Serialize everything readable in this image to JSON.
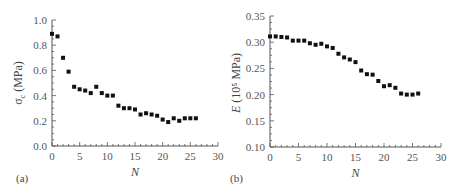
{
  "chart_data": [
    {
      "panel": "(a)",
      "type": "scatter",
      "title": "",
      "xlabel": "N",
      "ylabel": "σc (MPa)",
      "ylabel_main": "σ",
      "ylabel_sub": "c",
      "ylabel_unit": " (MPa)",
      "xlim": [
        0,
        30
      ],
      "ylim": [
        0.0,
        1.0
      ],
      "xticks": [
        0,
        5,
        10,
        15,
        20,
        25,
        30
      ],
      "xtick_labels": [
        "0",
        "5",
        "10",
        "15",
        "20",
        "25",
        "30"
      ],
      "yticks": [
        0.0,
        0.2,
        0.4,
        0.6,
        0.8,
        1.0
      ],
      "ytick_labels": [
        "0.0",
        "0.2",
        "0.4",
        "0.6",
        "0.8",
        "1.0"
      ],
      "grid": false,
      "x": [
        0,
        1,
        2,
        3,
        4,
        5,
        6,
        7,
        8,
        9,
        10,
        11,
        12,
        13,
        14,
        15,
        16,
        17,
        18,
        19,
        20,
        21,
        22,
        23,
        24,
        25,
        26
      ],
      "y": [
        0.89,
        0.87,
        0.7,
        0.59,
        0.47,
        0.45,
        0.44,
        0.42,
        0.47,
        0.42,
        0.4,
        0.4,
        0.32,
        0.3,
        0.3,
        0.29,
        0.25,
        0.26,
        0.25,
        0.24,
        0.21,
        0.19,
        0.22,
        0.2,
        0.22,
        0.22,
        0.22
      ]
    },
    {
      "panel": "(b)",
      "type": "scatter",
      "title": "",
      "xlabel": "N",
      "ylabel": "E (10^5 MPa)",
      "ylabel_main": "E",
      "ylabel_unit": " (10⁵ MPa)",
      "xlim": [
        0,
        30
      ],
      "ylim": [
        0.1,
        0.35
      ],
      "xticks": [
        0,
        5,
        10,
        15,
        20,
        25,
        30
      ],
      "xtick_labels": [
        "0",
        "5",
        "10",
        "15",
        "20",
        "25",
        "30"
      ],
      "yticks": [
        0.1,
        0.15,
        0.2,
        0.25,
        0.3,
        0.35
      ],
      "ytick_labels": [
        "0.10",
        "0.15",
        "0.20",
        "0.25",
        "0.30",
        "0.35"
      ],
      "grid": false,
      "x": [
        0,
        1,
        2,
        3,
        4,
        5,
        6,
        7,
        8,
        9,
        10,
        11,
        12,
        13,
        14,
        15,
        16,
        17,
        18,
        19,
        20,
        21,
        22,
        23,
        24,
        25,
        26
      ],
      "y": [
        0.311,
        0.311,
        0.31,
        0.309,
        0.303,
        0.303,
        0.303,
        0.298,
        0.295,
        0.297,
        0.292,
        0.289,
        0.278,
        0.271,
        0.267,
        0.262,
        0.246,
        0.239,
        0.238,
        0.226,
        0.216,
        0.218,
        0.213,
        0.202,
        0.2,
        0.2,
        0.202
      ]
    }
  ],
  "panels": {
    "a": {
      "label": "(a)",
      "xlabel": "N"
    },
    "b": {
      "label": "(b)",
      "xlabel": "N"
    }
  }
}
